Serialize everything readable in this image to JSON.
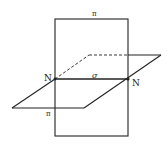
{
  "diagram": {
    "type": "intersecting-planes",
    "labels": {
      "plane_vertical_top": "π",
      "plane_horizontal": "π",
      "intersection_line": "σ",
      "point_left": "N",
      "point_right": "N"
    },
    "colors": {
      "line": "#222222",
      "background": "#ffffff"
    }
  }
}
